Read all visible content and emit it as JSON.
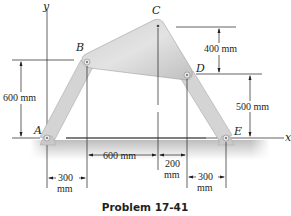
{
  "figure": {
    "caption": "Problem 17-41",
    "axes": {
      "x_label": "x",
      "y_label": "y"
    },
    "points": {
      "A": "A",
      "B": "B",
      "C": "C",
      "D": "D",
      "E": "E"
    },
    "dimensions": {
      "left_height": "600 mm",
      "c_to_d": "400 mm",
      "d_to_e": "500 mm",
      "b_to_c_horizontal": "600 mm",
      "c_to_d_horizontal_value": "200",
      "c_to_d_horizontal_unit": "mm",
      "a_to_b_horizontal_value": "300",
      "a_to_b_horizontal_unit": "mm",
      "d_to_e_horizontal_value": "300",
      "d_to_e_horizontal_unit": "mm"
    },
    "colors": {
      "link_fill": "#d9d9d9",
      "link_stroke": "#9a9a9a",
      "ground": "#c8c8c8",
      "line": "#231f20"
    }
  }
}
